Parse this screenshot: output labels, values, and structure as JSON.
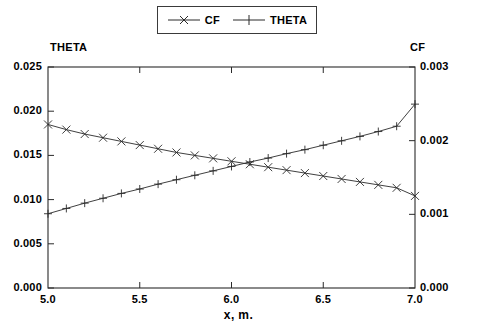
{
  "legend": {
    "entries": [
      {
        "label": "CF",
        "marker": "x-marker",
        "color": "#1a1a1a"
      },
      {
        "label": "THETA",
        "marker": "plus-marker",
        "color": "#1a1a1a"
      }
    ]
  },
  "axis_titles": {
    "left": "THETA",
    "right": "CF"
  },
  "chart_data": {
    "type": "line",
    "title": "",
    "xlabel": "x, m.",
    "ylabel": "THETA",
    "y2label": "CF",
    "xlim": [
      5.0,
      7.0
    ],
    "ylim": [
      0.0,
      0.025
    ],
    "y2lim": [
      0.0,
      0.003
    ],
    "xticks": [
      "5.0",
      "5.5",
      "6.0",
      "6.5",
      "7.0"
    ],
    "xtick_values": [
      5.0,
      5.5,
      6.0,
      6.5,
      7.0
    ],
    "yticks": [
      "0.000",
      "0.005",
      "0.010",
      "0.015",
      "0.020",
      "0.025"
    ],
    "ytick_values": [
      0.0,
      0.005,
      0.01,
      0.015,
      0.02,
      0.025
    ],
    "y2ticks": [
      "0.000",
      "0.001",
      "0.002",
      "0.003"
    ],
    "y2tick_values": [
      0.0,
      0.001,
      0.002,
      0.003
    ],
    "grid": false,
    "legend_position": "top-center",
    "x": [
      5.0,
      5.1,
      5.2,
      5.3,
      5.4,
      5.5,
      5.6,
      5.7,
      5.8,
      5.9,
      6.0,
      6.1,
      6.2,
      6.3,
      6.4,
      6.5,
      6.6,
      6.7,
      6.8,
      6.9,
      7.0
    ],
    "series": [
      {
        "name": "CF",
        "axis": "right",
        "marker": "x",
        "values": [
          0.00222,
          0.00215,
          0.00209,
          0.00204,
          0.00199,
          0.00194,
          0.00189,
          0.00184,
          0.0018,
          0.00176,
          0.00172,
          0.00168,
          0.00164,
          0.0016,
          0.00156,
          0.00152,
          0.00148,
          0.00144,
          0.0014,
          0.00136,
          0.00125
        ]
      },
      {
        "name": "THETA",
        "axis": "left",
        "marker": "+",
        "values": [
          0.0084,
          0.009,
          0.0096,
          0.01015,
          0.0107,
          0.0112,
          0.01175,
          0.01225,
          0.01275,
          0.01325,
          0.01375,
          0.01425,
          0.0147,
          0.0152,
          0.01565,
          0.01615,
          0.01665,
          0.01715,
          0.0177,
          0.0183,
          0.0208
        ]
      }
    ],
    "crossing_point": {
      "x": 6.4,
      "y_left": 0.0156,
      "y_right": 0.00156
    }
  }
}
